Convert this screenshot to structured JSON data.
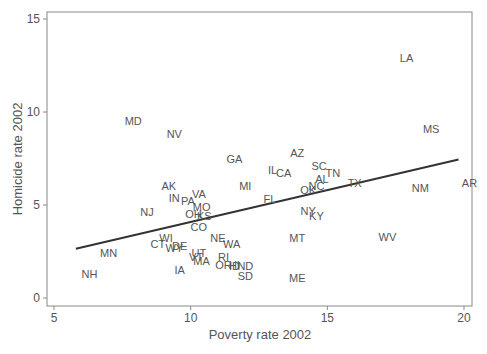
{
  "chart_data": {
    "type": "scatter",
    "title": "",
    "xlabel": "Poverty rate 2002",
    "ylabel": "Homicide rate 2002",
    "xlim": [
      4.8,
      20.3
    ],
    "ylim": [
      -0.6,
      15.4
    ],
    "xticks": [
      5,
      10,
      15,
      20
    ],
    "yticks": [
      0,
      5,
      10,
      15
    ],
    "grid": false,
    "legend": null,
    "marker": "state-abbreviation-label",
    "fit_line": {
      "x": [
        5.8,
        19.8
      ],
      "y": [
        2.65,
        7.45
      ]
    },
    "points": [
      {
        "label": "LA",
        "x": 17.9,
        "y": 12.9
      },
      {
        "label": "MD",
        "x": 7.9,
        "y": 9.5
      },
      {
        "label": "MS",
        "x": 18.8,
        "y": 9.1
      },
      {
        "label": "NV",
        "x": 9.4,
        "y": 8.8
      },
      {
        "label": "AZ",
        "x": 13.9,
        "y": 7.8
      },
      {
        "label": "GA",
        "x": 11.6,
        "y": 7.5
      },
      {
        "label": "SC",
        "x": 14.7,
        "y": 7.1
      },
      {
        "label": "IL",
        "x": 13.0,
        "y": 6.9
      },
      {
        "label": "CA",
        "x": 13.4,
        "y": 6.7
      },
      {
        "label": "TN",
        "x": 15.2,
        "y": 6.7
      },
      {
        "label": "AL",
        "x": 14.8,
        "y": 6.4
      },
      {
        "label": "TX",
        "x": 16.0,
        "y": 6.2
      },
      {
        "label": "AR",
        "x": 20.2,
        "y": 6.2
      },
      {
        "label": "MI",
        "x": 12.0,
        "y": 6.0
      },
      {
        "label": "NC",
        "x": 14.6,
        "y": 6.0
      },
      {
        "label": "AK",
        "x": 9.2,
        "y": 6.0
      },
      {
        "label": "NM",
        "x": 18.4,
        "y": 5.9
      },
      {
        "label": "OK",
        "x": 14.3,
        "y": 5.8
      },
      {
        "label": "VA",
        "x": 10.3,
        "y": 5.6
      },
      {
        "label": "IN",
        "x": 9.4,
        "y": 5.4
      },
      {
        "label": "PA",
        "x": 9.9,
        "y": 5.2
      },
      {
        "label": "FL",
        "x": 12.9,
        "y": 5.3
      },
      {
        "label": "MO",
        "x": 10.4,
        "y": 4.9
      },
      {
        "label": "NY",
        "x": 14.3,
        "y": 4.7
      },
      {
        "label": "NJ",
        "x": 8.4,
        "y": 4.6
      },
      {
        "label": "OH",
        "x": 10.1,
        "y": 4.5
      },
      {
        "label": "KS",
        "x": 10.5,
        "y": 4.4
      },
      {
        "label": "KY",
        "x": 14.6,
        "y": 4.4
      },
      {
        "label": "CO",
        "x": 10.3,
        "y": 3.8
      },
      {
        "label": "WV",
        "x": 17.2,
        "y": 3.3
      },
      {
        "label": "WI",
        "x": 9.1,
        "y": 3.2
      },
      {
        "label": "MT",
        "x": 13.9,
        "y": 3.2
      },
      {
        "label": "NE",
        "x": 11.0,
        "y": 3.2
      },
      {
        "label": "WA",
        "x": 11.5,
        "y": 2.9
      },
      {
        "label": "CT",
        "x": 8.8,
        "y": 2.9
      },
      {
        "label": "DE",
        "x": 9.6,
        "y": 2.8
      },
      {
        "label": "WY",
        "x": 9.4,
        "y": 2.7
      },
      {
        "label": "MN",
        "x": 7.0,
        "y": 2.4
      },
      {
        "label": "UT",
        "x": 10.3,
        "y": 2.4
      },
      {
        "label": "VT",
        "x": 10.2,
        "y": 2.2
      },
      {
        "label": "MA",
        "x": 10.4,
        "y": 2.0
      },
      {
        "label": "RI",
        "x": 11.2,
        "y": 2.2
      },
      {
        "label": "OR",
        "x": 11.2,
        "y": 1.8
      },
      {
        "label": "HI",
        "x": 11.6,
        "y": 1.8
      },
      {
        "label": "ID",
        "x": 11.6,
        "y": 1.7
      },
      {
        "label": "ND",
        "x": 12.0,
        "y": 1.7
      },
      {
        "label": "IA",
        "x": 9.6,
        "y": 1.5
      },
      {
        "label": "SD",
        "x": 12.0,
        "y": 1.2
      },
      {
        "label": "NH",
        "x": 6.3,
        "y": 1.3
      },
      {
        "label": "ME",
        "x": 13.9,
        "y": 1.1
      }
    ]
  },
  "axes": {
    "xlabel": "Poverty rate 2002",
    "ylabel": "Homicide rate 2002",
    "xtick_labels": [
      "5",
      "10",
      "15",
      "20"
    ],
    "ytick_labels": [
      "0",
      "5",
      "10",
      "15"
    ]
  },
  "colors": {
    "frame": "#888888",
    "text": "#555555",
    "fit_line": "#333333"
  }
}
